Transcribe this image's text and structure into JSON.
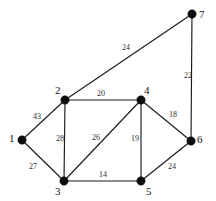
{
  "figure": {
    "type": "undirected-weighted-graph",
    "width": 216,
    "height": 201,
    "background_color": "#ffffff",
    "node_color": "#0d0d0d",
    "edge_color": "#1a1a1a",
    "label_color": "#111111",
    "weight_color": "#2b2b2b"
  },
  "chart_data": {
    "type": "diagram",
    "title": "",
    "xlabel": "",
    "ylabel": "",
    "nodes": [
      {
        "id": "1",
        "label": "1",
        "x": 22,
        "y": 140,
        "label_x": 9,
        "label_y": 133
      },
      {
        "id": "2",
        "label": "2",
        "x": 65,
        "y": 100,
        "label_x": 55,
        "label_y": 85
      },
      {
        "id": "3",
        "label": "3",
        "x": 64,
        "y": 181,
        "label_x": 55,
        "label_y": 186
      },
      {
        "id": "4",
        "label": "4",
        "x": 141,
        "y": 100,
        "label_x": 144,
        "label_y": 85
      },
      {
        "id": "5",
        "label": "5",
        "x": 141,
        "y": 181,
        "label_x": 146,
        "label_y": 186
      },
      {
        "id": "6",
        "label": "6",
        "x": 191,
        "y": 141,
        "label_x": 197,
        "label_y": 134
      },
      {
        "id": "7",
        "label": "7",
        "x": 192,
        "y": 14,
        "label_x": 199,
        "label_y": 9
      }
    ],
    "edges": [
      {
        "source": "1",
        "target": "2",
        "weight": 43,
        "label_x": 33,
        "label_y": 113
      },
      {
        "source": "1",
        "target": "3",
        "weight": 27,
        "label_x": 29,
        "label_y": 163
      },
      {
        "source": "2",
        "target": "3",
        "weight": 28,
        "label_x": 56,
        "label_y": 135
      },
      {
        "source": "2",
        "target": "4",
        "weight": 20,
        "label_x": 97,
        "label_y": 90
      },
      {
        "source": "2",
        "target": "7",
        "weight": 24,
        "label_x": 122,
        "label_y": 44
      },
      {
        "source": "3",
        "target": "4",
        "weight": 26,
        "label_x": 92,
        "label_y": 134
      },
      {
        "source": "3",
        "target": "5",
        "weight": 14,
        "label_x": 99,
        "label_y": 171
      },
      {
        "source": "4",
        "target": "5",
        "weight": 19,
        "label_x": 131,
        "label_y": 135
      },
      {
        "source": "4",
        "target": "6",
        "weight": 18,
        "label_x": 169,
        "label_y": 111
      },
      {
        "source": "5",
        "target": "6",
        "weight": 24,
        "label_x": 168,
        "label_y": 163
      },
      {
        "source": "6",
        "target": "7",
        "weight": 22,
        "label_x": 184,
        "label_y": 72
      }
    ],
    "node_radius": 4.2,
    "legend": null,
    "grid": false
  }
}
